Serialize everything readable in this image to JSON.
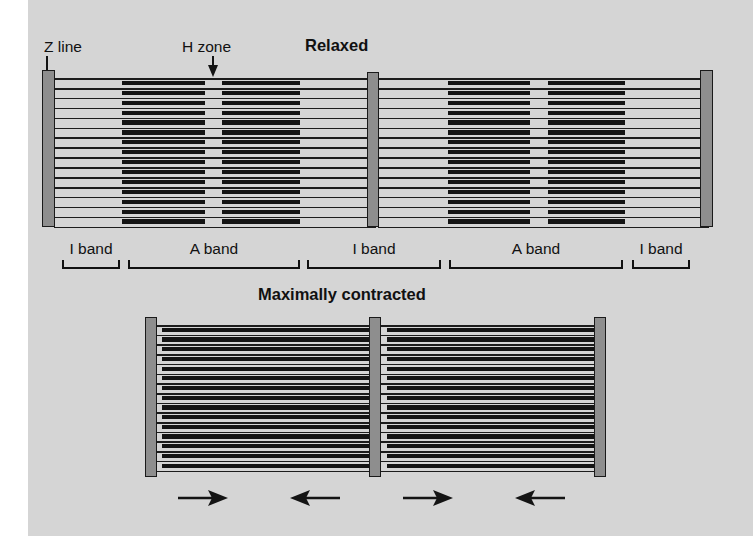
{
  "figure": {
    "background_color": "#d5d5d5",
    "page_color": "#ffffff",
    "ink_color": "#141414",
    "zline_fill": "#8e8e8e"
  },
  "annotations": {
    "z_line_label": "Z line",
    "h_zone_label": "H zone",
    "z_line_pointer": "down-arrow",
    "h_zone_pointer": "down-arrow"
  },
  "panels": [
    {
      "id": "relaxed",
      "title": "Relaxed",
      "z_lines": 3,
      "sarcomeres": 2,
      "thin_filament_rows": 16,
      "h_zone_visible": true,
      "band_labels": [
        {
          "label": "I band"
        },
        {
          "label": "A band"
        },
        {
          "label": "I band"
        },
        {
          "label": "A band"
        },
        {
          "label": "I band"
        }
      ]
    },
    {
      "id": "contracted",
      "title": "Maximally contracted",
      "z_lines": 3,
      "sarcomeres": 2,
      "thin_filament_rows": 16,
      "h_zone_visible": false,
      "sliding_arrows": [
        {
          "direction": "right"
        },
        {
          "direction": "left"
        },
        {
          "direction": "right"
        },
        {
          "direction": "left"
        }
      ]
    }
  ],
  "chart_data": {
    "type": "diagram",
    "states": [
      "Relaxed",
      "Maximally contracted"
    ],
    "structures": [
      "Z line",
      "H zone",
      "I band",
      "A band"
    ],
    "relaxed": {
      "z_line_positions_px": [
        48,
        372,
        705
      ],
      "sarcomere_length_px": [
        324,
        333
      ],
      "a_band_extent_px": [
        [
          122,
          300
        ],
        [
          448,
          625
        ]
      ],
      "h_zone_extent_px": [
        [
          205,
          222
        ],
        [
          530,
          548
        ]
      ],
      "filament_rows": 16
    },
    "contracted": {
      "z_line_positions_px": [
        150,
        375,
        600
      ],
      "sarcomere_length_px": [
        225,
        225
      ],
      "a_band_fills_sarcomere": true,
      "h_zone_extent_px": [],
      "filament_rows": 16
    },
    "band_sequence": [
      "I band",
      "A band",
      "I band",
      "A band",
      "I band"
    ],
    "arrow_directions": [
      "right",
      "left",
      "right",
      "left"
    ],
    "annotation": "Thick (myosin) filaments slide past thin (actin) filaments; I bands and H zones shorten while A band length is unchanged."
  }
}
